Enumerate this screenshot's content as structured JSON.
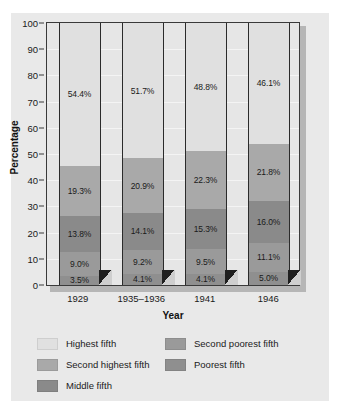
{
  "chart_data": {
    "type": "bar",
    "subtype": "stacked-bar-100",
    "title": "",
    "xlabel": "Year",
    "ylabel": "Percentage",
    "ylim": [
      0,
      100
    ],
    "yticks": [
      0,
      10,
      20,
      30,
      40,
      50,
      60,
      70,
      80,
      90,
      100
    ],
    "grid": true,
    "legend_position": "bottom",
    "categories": [
      "1929",
      "1935–1936",
      "1941",
      "1946"
    ],
    "series": [
      {
        "name": "Highest fifth",
        "color": "#e0e0e0",
        "values": [
          54.4,
          51.7,
          48.8,
          46.1
        ],
        "labels": [
          "54.4%",
          "51.7%",
          "48.8%",
          "46.1%"
        ]
      },
      {
        "name": "Second highest fifth",
        "color": "#a9a9a9",
        "values": [
          19.3,
          20.9,
          22.3,
          21.8
        ],
        "labels": [
          "19.3%",
          "20.9%",
          "22.3%",
          "21.8%"
        ]
      },
      {
        "name": "Middle fifth",
        "color": "#8a8a8a",
        "values": [
          13.8,
          14.1,
          15.3,
          16.0
        ],
        "labels": [
          "13.8%",
          "14.1%",
          "15.3%",
          "16.0%"
        ]
      },
      {
        "name": "Second poorest fifth",
        "color": "#9a9a9a",
        "values": [
          9.0,
          9.2,
          9.5,
          11.1
        ],
        "labels": [
          "9.0%",
          "9.2%",
          "9.5%",
          "11.1%"
        ]
      },
      {
        "name": "Poorest fifth",
        "color": "#8f8f8f",
        "values": [
          3.5,
          4.1,
          4.1,
          5.0
        ],
        "labels": [
          "3.5%",
          "4.1%",
          "4.1%",
          "5.0%"
        ]
      }
    ],
    "stack_order_bottom_to_top": [
      "Poorest fifth",
      "Second poorest fifth",
      "Middle fifth",
      "Second highest fifth",
      "Highest fifth"
    ]
  },
  "legend": {
    "entries": [
      {
        "label": "Highest fifth",
        "color": "#e0e0e0"
      },
      {
        "label": "Second poorest fifth",
        "color": "#9a9a9a"
      },
      {
        "label": "Second highest fifth",
        "color": "#a9a9a9"
      },
      {
        "label": "Poorest fifth",
        "color": "#8f8f8f"
      },
      {
        "label": "Middle fifth",
        "color": "#8a8a8a"
      }
    ]
  },
  "colors": {
    "card_background": "#e9e9e9",
    "plot_background": "#e6e6e6",
    "frame": "#3a3a3a",
    "frame_shadow": "#b6b6b6",
    "gridline": "#f4f4f4",
    "text": "#1a1a1a"
  }
}
